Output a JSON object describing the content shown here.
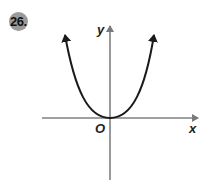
{
  "problem": {
    "number": "26."
  },
  "graph": {
    "x_axis_label": "x",
    "y_axis_label": "y",
    "origin_label": "O",
    "curve": "parabola opening upward with vertex at origin",
    "axis_color": "#808080",
    "curve_color": "#1a1a1a"
  }
}
